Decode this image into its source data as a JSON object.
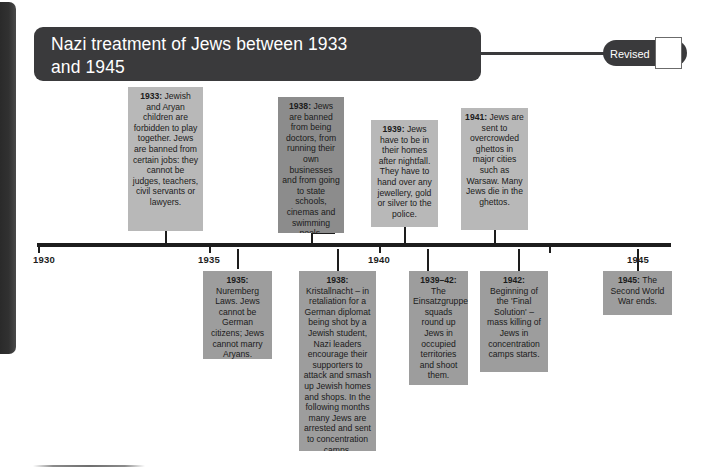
{
  "title": {
    "text": "Nazi treatment of Jews between 1933\nand 1945"
  },
  "revised": {
    "label": "Revised",
    "checked": false
  },
  "axis": {
    "years": [
      "1930",
      "1935",
      "1940",
      "1945"
    ]
  },
  "colors": {
    "banner": "#3a3a3c",
    "axis": "#1d1d1d",
    "card_light": "#b8b8b8",
    "card_mid": "#9d9d9d",
    "card_dark": "#8c8c8c",
    "page_background": "#ffffff"
  },
  "events_above": [
    {
      "year": "1933:",
      "text": " Jewish and Aryan children are forbidden to play together. Jews are banned from certain jobs: they cannot be judges, teachers, civil servants or lawyers."
    },
    {
      "year": "1938:",
      "text": " Jews are banned from being doctors, from running their own businesses and from going to state schools, cinemas and swimming pools."
    },
    {
      "year": "1939:",
      "text": " Jews have to be in their homes after nightfall. They have to hand over any jewellery, gold or silver to the police."
    },
    {
      "year": "1941:",
      "text": " Jews are sent to overcrowded ghettos in major cities such as Warsaw. Many Jews die in the ghettos."
    }
  ],
  "events_below": [
    {
      "year": "1935:",
      "text": " Nuremberg Laws. Jews cannot be German citizens; Jews cannot marry Aryans."
    },
    {
      "year": "1938:",
      "text": " Kristallnacht – in retaliation for a German diplomat being shot by a Jewish student, Nazi leaders encourage their supporters to attack and smash up Jewish homes and shops. In the following months many Jews are arrested and sent to concentration camps."
    },
    {
      "year": "1939–42:",
      "text": " The Einsatzgruppen squads round up Jews in occupied territories and shoot them."
    },
    {
      "year": "1942:",
      "text": " Beginning of the 'Final Solution' – mass killing of Jews in concentration camps starts."
    },
    {
      "year": "1945:",
      "text": " The Second World War ends."
    }
  ]
}
